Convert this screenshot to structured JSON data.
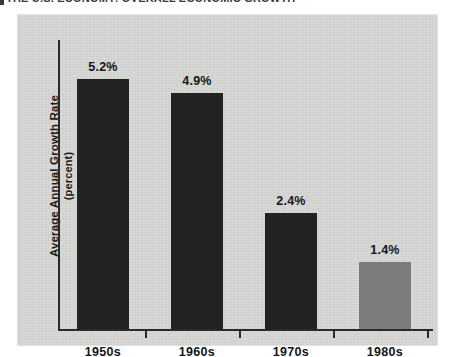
{
  "page": {
    "caption_sliver": "THE U.S. ECONOMY:  OVERALL ECONOMIC GROWTH"
  },
  "chart_panel": {
    "background_color": "#d6d6d4"
  },
  "chart_data": {
    "type": "bar",
    "title": "",
    "subtitle": "",
    "xlabel": "",
    "ylabel": "Average Annual Growth Rate",
    "ylabel_line2": "(percent)",
    "categories": [
      "1950s",
      "1960s",
      "1970s",
      "1980s"
    ],
    "values": [
      5.2,
      4.9,
      2.4,
      1.4
    ],
    "value_labels": [
      "5.2%",
      "4.9%",
      "2.4%",
      "1.4%"
    ],
    "bar_colors": [
      "#232323",
      "#232323",
      "#232323",
      "#7c7c7c"
    ],
    "ylim": [
      0,
      6.0
    ],
    "grid": false,
    "legend": null,
    "axis_color": "#2a2a2a",
    "tick_marks_between_categories": true
  }
}
